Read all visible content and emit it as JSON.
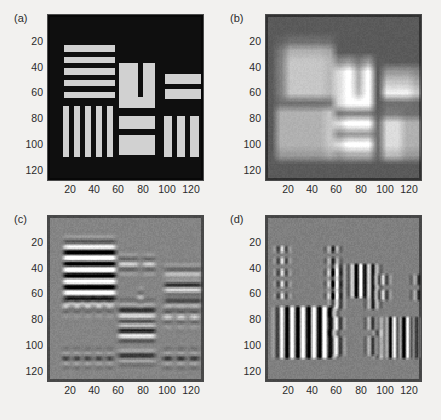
{
  "figure": {
    "background_color": "#f2f1ef",
    "axis_color": "#4a4a4a",
    "text_color": "#2b2b2b",
    "width": 441,
    "height": 420
  },
  "panels": [
    {
      "label": "(a)",
      "name": "panel-a-original-test-pattern",
      "description": "Original resolution test pattern: bright bars on dark background"
    },
    {
      "label": "(b)",
      "name": "panel-b-blurred-grayscale",
      "description": "Low-pass filtered / blurred blocky grayscale version"
    },
    {
      "label": "(c)",
      "name": "panel-c-horizontal-edge-response",
      "description": "Horizontal edge / ringing filter response, mid-gray background"
    },
    {
      "label": "(d)",
      "name": "panel-d-vertical-edge-response",
      "description": "Vertical edge filter response, mid-gray background"
    }
  ],
  "axes": {
    "xticks": [
      20,
      40,
      60,
      80,
      100,
      120
    ],
    "yticks": [
      20,
      40,
      60,
      80,
      100,
      120
    ],
    "xlim": [
      1,
      128
    ],
    "ylim": [
      1,
      128
    ],
    "xlabel": "",
    "ylabel": "",
    "grid": false,
    "ydirection": "reverse"
  },
  "chart_data": {
    "type": "heatmap",
    "title": "",
    "subtitle": "",
    "xlabel": "",
    "ylabel": "",
    "xlim": [
      1,
      128
    ],
    "ylim": [
      1,
      128
    ],
    "xticks": [
      20,
      40,
      60,
      80,
      100,
      120
    ],
    "yticks": [
      20,
      40,
      60,
      80,
      100,
      120
    ],
    "grid": false,
    "legend": "none",
    "colormap": "gray",
    "panel_count": 4,
    "panel_layout": "2x2",
    "panels": [
      {
        "label": "(a)",
        "kind": "original",
        "background_level": 0.06,
        "bar_level": 0.82,
        "features": [
          {
            "shape": "horizontal-bar-group",
            "x": [
              13,
              55
            ],
            "y": [
              23,
              67
            ],
            "bars": 5,
            "period": 9,
            "thickness": 4.5
          },
          {
            "shape": "vertical-bar-group",
            "x": [
              12,
              52
            ],
            "y": [
              70,
              110
            ],
            "bars": 5,
            "period": 9,
            "thickness": 4.5
          },
          {
            "shape": "block",
            "x": [
              58,
              74
            ],
            "y": [
              37,
              72
            ]
          },
          {
            "shape": "block",
            "x": [
              78,
              88
            ],
            "y": [
              37,
              72
            ]
          },
          {
            "shape": "block",
            "x": [
              58,
              88
            ],
            "y": [
              63,
              72
            ]
          },
          {
            "shape": "block",
            "x": [
              58,
              88
            ],
            "y": [
              78,
              88
            ]
          },
          {
            "shape": "block",
            "x": [
              58,
              88
            ],
            "y": [
              93,
              108
            ]
          },
          {
            "shape": "block",
            "x": [
              96,
              126
            ],
            "y": [
              45,
              53
            ]
          },
          {
            "shape": "block",
            "x": [
              96,
              126
            ],
            "y": [
              57,
              65
            ]
          },
          {
            "shape": "vertical-bar-group",
            "x": [
              95,
              127
            ],
            "y": [
              78,
              110
            ],
            "bars": 3,
            "period": 11,
            "thickness": 7
          }
        ]
      },
      {
        "label": "(b)",
        "kind": "blurred",
        "background_level": 0.55,
        "min_level": 0.12,
        "max_level": 0.97,
        "blocks": [
          {
            "x": [
              1,
              50
            ],
            "y": [
              1,
              30
            ],
            "level": 0.33
          },
          {
            "x": [
              50,
              100
            ],
            "y": [
              1,
              30
            ],
            "level": 0.6
          },
          {
            "x": [
              100,
              128
            ],
            "y": [
              1,
              30
            ],
            "level": 0.58
          },
          {
            "x": [
              1,
              50
            ],
            "y": [
              30,
              60
            ],
            "level": 0.42
          },
          {
            "x": [
              50,
              100
            ],
            "y": [
              30,
              60
            ],
            "level": 0.5
          },
          {
            "x": [
              100,
              128
            ],
            "y": [
              30,
              60
            ],
            "level": 0.72
          },
          {
            "x": [
              1,
              50
            ],
            "y": [
              60,
              100
            ],
            "level": 0.18
          },
          {
            "x": [
              50,
              100
            ],
            "y": [
              60,
              100
            ],
            "level": 0.8
          },
          {
            "x": [
              100,
              128
            ],
            "y": [
              60,
              100
            ],
            "level": 0.62
          },
          {
            "x": [
              1,
              50
            ],
            "y": [
              100,
              128
            ],
            "level": 0.28
          },
          {
            "x": [
              50,
              100
            ],
            "y": [
              100,
              128
            ],
            "level": 0.66
          },
          {
            "x": [
              100,
              128
            ],
            "y": [
              100,
              128
            ],
            "level": 0.6
          }
        ]
      },
      {
        "label": "(c)",
        "kind": "horizontal-edge-response",
        "background_level": 0.52,
        "min_level": 0.05,
        "max_level": 0.95
      },
      {
        "label": "(d)",
        "kind": "vertical-edge-response",
        "background_level": 0.5,
        "min_level": 0.05,
        "max_level": 0.95
      }
    ]
  }
}
